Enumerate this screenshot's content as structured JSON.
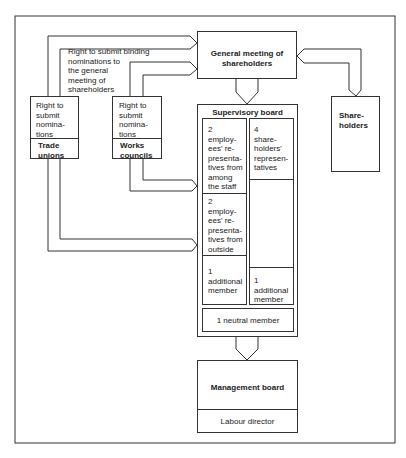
{
  "diagram": {
    "general_meeting": {
      "label": "General meeting of shareholders"
    },
    "binding_nominations_note": {
      "lines": [
        "Right to submit binding",
        "nominations to",
        "the general",
        "meeting of",
        "shareholders"
      ]
    },
    "trade_unions": {
      "right_lines": [
        "Right to",
        "submit",
        "nomina-",
        "tions"
      ],
      "name_lines": [
        "Trade",
        "unions"
      ]
    },
    "works_councils": {
      "right_lines": [
        "Right to",
        "submit",
        "nomina-",
        "tions"
      ],
      "name_lines": [
        "Works",
        "councils"
      ]
    },
    "shareholders": {
      "lines": [
        "Share-",
        "holders"
      ]
    },
    "supervisory_board": {
      "title": "Supervisory board",
      "employee_staff": {
        "lines": [
          "2",
          "employ-",
          "ees' re-",
          "presenta-",
          "tives from",
          "among",
          "the staff"
        ]
      },
      "employee_outside": {
        "lines": [
          "2",
          "employ-",
          "ees' re-",
          "presenta-",
          "tives from",
          "outside"
        ]
      },
      "additional_left": {
        "lines": [
          "1",
          "additional",
          "member"
        ]
      },
      "shareholder_reps": {
        "lines": [
          "4",
          "share-",
          "holders'",
          "represen-",
          "tatives"
        ]
      },
      "additional_right": {
        "lines": [
          "1",
          "additional",
          "member"
        ]
      },
      "neutral": {
        "label": "1 neutral member"
      }
    },
    "management_board": {
      "title": "Management board",
      "labour_director": "Labour director"
    }
  }
}
